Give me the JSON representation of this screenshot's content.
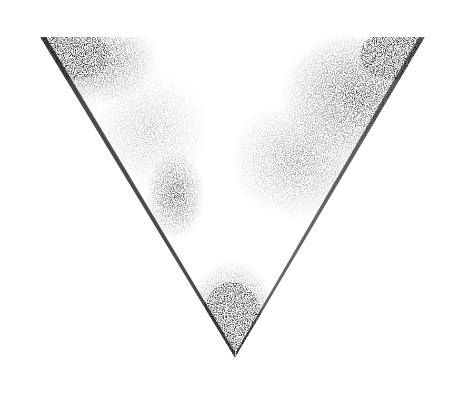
{
  "image": {
    "subject": "stippled inverted triangle",
    "background": "#ffffff",
    "ink": "#000000",
    "triangle": {
      "top_left": [
        40,
        37
      ],
      "top_right": [
        425,
        37
      ],
      "bottom": [
        235,
        358
      ]
    },
    "dark_regions": [
      {
        "name": "top-left-corner",
        "cx": 90,
        "cy": 60,
        "rx": 55,
        "ry": 35
      },
      {
        "name": "top-right-mottled",
        "cx": 360,
        "cy": 90,
        "rx": 60,
        "ry": 50
      },
      {
        "name": "center-left-streak",
        "cx": 175,
        "cy": 195,
        "rx": 25,
        "ry": 40
      },
      {
        "name": "bottom-tip",
        "cx": 232,
        "cy": 310,
        "rx": 38,
        "ry": 45
      }
    ],
    "highlight": {
      "name": "light-orb",
      "cx": 203,
      "cy": 251,
      "r": 11
    }
  }
}
